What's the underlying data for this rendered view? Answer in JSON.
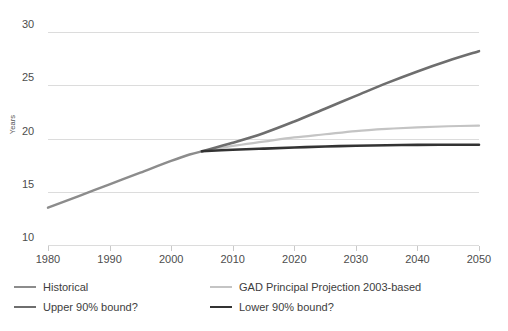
{
  "chart_data": {
    "type": "line",
    "title": "",
    "subtitle": "",
    "xlabel": "",
    "ylabel": "Years",
    "xlim": [
      1975,
      2050
    ],
    "ylim": [
      8.6,
      31.5
    ],
    "xticks": [
      1980,
      1990,
      2000,
      2010,
      2020,
      2030,
      2040,
      2050
    ],
    "xtick_labels": [
      "1980",
      "1990",
      "2000",
      "2010",
      "2020",
      "2030",
      "2040",
      "2050"
    ],
    "yticks": [
      10,
      15,
      20,
      25,
      30
    ],
    "ytick_labels": [
      "10",
      "15",
      "20",
      "25",
      "30"
    ],
    "grid": "horizontal",
    "legend_position": "below",
    "series": [
      {
        "name": "Historical",
        "color": "#8c8c8c",
        "width": 2.4,
        "x": [
          1980,
          1985,
          1990,
          1995,
          2000,
          2003,
          2005
        ],
        "values": [
          13.5,
          14.6,
          15.7,
          16.8,
          17.9,
          18.5,
          18.8
        ]
      },
      {
        "name": "Upper 90% bound?",
        "color": "#6e6e6e",
        "width": 2.6,
        "x": [
          2005,
          2010,
          2015,
          2020,
          2025,
          2030,
          2035,
          2040,
          2045,
          2050
        ],
        "values": [
          18.8,
          19.6,
          20.5,
          21.6,
          22.8,
          24.0,
          25.2,
          26.3,
          27.3,
          28.2
        ]
      },
      {
        "name": "GAD Principal Projection 2003-based",
        "color": "#c4c4c4",
        "width": 2.2,
        "x": [
          2005,
          2010,
          2015,
          2020,
          2025,
          2030,
          2035,
          2040,
          2045,
          2050
        ],
        "values": [
          18.8,
          19.3,
          19.7,
          20.1,
          20.4,
          20.7,
          20.9,
          21.05,
          21.15,
          21.2
        ]
      },
      {
        "name": "Lower 90% bound?",
        "color": "#333333",
        "width": 2.6,
        "x": [
          2005,
          2010,
          2015,
          2020,
          2025,
          2030,
          2035,
          2040,
          2045,
          2050
        ],
        "values": [
          18.8,
          18.95,
          19.05,
          19.15,
          19.25,
          19.32,
          19.37,
          19.4,
          19.41,
          19.42
        ]
      }
    ]
  },
  "legend": {
    "items": [
      {
        "label": "Historical",
        "color": "#8c8c8c",
        "width": "2.4px"
      },
      {
        "label": "GAD Principal Projection 2003-based",
        "color": "#c4c4c4",
        "width": "2.2px"
      },
      {
        "label": "Upper 90% bound?",
        "color": "#6e6e6e",
        "width": "2.6px"
      },
      {
        "label": "Lower 90% bound?",
        "color": "#333333",
        "width": "2.6px"
      }
    ]
  },
  "axes": {
    "y_title": "Years"
  }
}
